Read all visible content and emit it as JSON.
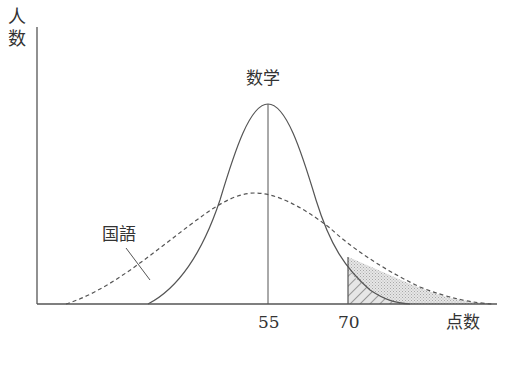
{
  "chart_data": {
    "type": "line",
    "title": "",
    "xlabel": "点数",
    "ylabel": "人数",
    "x_ticks": [
      "55",
      "70"
    ],
    "series": [
      {
        "name": "数学",
        "style": "solid",
        "mean": 55,
        "relative_peak": 1.0,
        "spread": "narrow"
      },
      {
        "name": "国語",
        "style": "dashed",
        "mean": 53,
        "relative_peak": 0.55,
        "spread": "wide"
      }
    ],
    "annotations": [
      {
        "type": "vertical_line",
        "x": 55,
        "series": "数学"
      },
      {
        "type": "vertical_line",
        "x": 70
      },
      {
        "type": "shaded_region",
        "from_x": 70,
        "series": "国語",
        "fill": "dotted gray"
      },
      {
        "type": "shaded_region",
        "from_x": 70,
        "series": "数学",
        "fill": "diagonal hatch"
      }
    ],
    "grid": false,
    "legend": "inline labels"
  },
  "labels": {
    "y_axis": "人数",
    "x_axis": "点数",
    "math": "数学",
    "japanese": "国語",
    "tick_55": "55",
    "tick_70": "70"
  },
  "colors": {
    "line": "#555555",
    "dot_fill": "#d4d4d4",
    "hatch": "#555555"
  }
}
